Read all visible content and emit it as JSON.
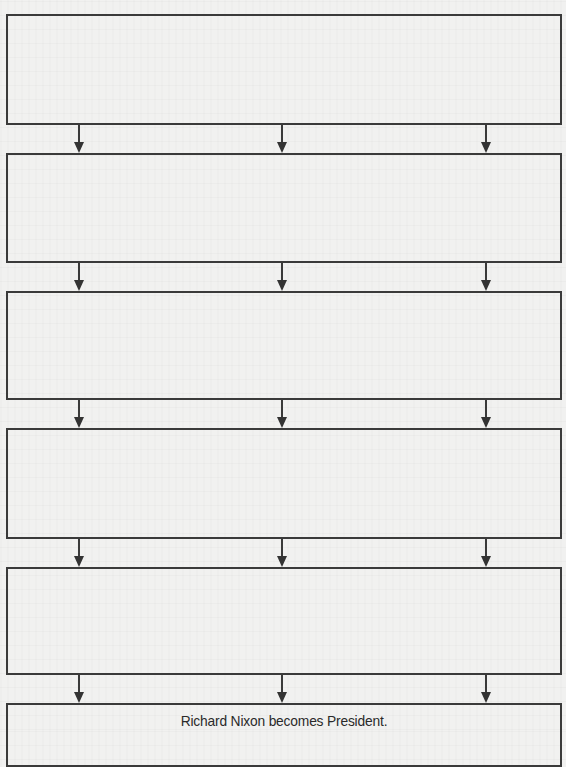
{
  "diagram": {
    "type": "flowchart",
    "direction": "top-to-bottom",
    "colors": {
      "line": "#3a3a3a",
      "paper": "#f1f1f0",
      "text": "#2a2a2a"
    },
    "boxes": [
      {
        "id": "box-1",
        "label": "",
        "top": 14,
        "height": 107
      },
      {
        "id": "box-2",
        "label": "",
        "top": 153,
        "height": 106
      },
      {
        "id": "box-3",
        "label": "",
        "top": 291,
        "height": 105
      },
      {
        "id": "box-4",
        "label": "",
        "top": 428,
        "height": 107
      },
      {
        "id": "box-5",
        "label": "",
        "top": 567,
        "height": 104
      },
      {
        "id": "box-6",
        "label": "Richard Nixon becomes President.",
        "top": 703,
        "height": 60
      }
    ],
    "arrow_columns_x": [
      79,
      282,
      486
    ],
    "arrows_between": [
      {
        "from": "box-1",
        "to": "box-2",
        "top": 123,
        "length": 30
      },
      {
        "from": "box-2",
        "to": "box-3",
        "top": 261,
        "length": 30
      },
      {
        "from": "box-3",
        "to": "box-4",
        "top": 398,
        "length": 30
      },
      {
        "from": "box-4",
        "to": "box-5",
        "top": 537,
        "length": 30
      },
      {
        "from": "box-5",
        "to": "box-6",
        "top": 673,
        "length": 30
      }
    ]
  }
}
